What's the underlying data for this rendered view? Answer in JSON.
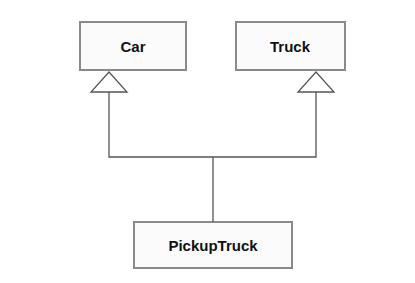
{
  "diagram": {
    "type": "uml-class-inheritance",
    "classes": [
      {
        "id": "car",
        "name": "Car"
      },
      {
        "id": "truck",
        "name": "Truck"
      },
      {
        "id": "pickuptruck",
        "name": "PickupTruck"
      }
    ],
    "relationships": [
      {
        "type": "generalization",
        "from": "PickupTruck",
        "to": "Car"
      },
      {
        "type": "generalization",
        "from": "PickupTruck",
        "to": "Truck"
      }
    ],
    "colors": {
      "box_border": "#8a8a8a",
      "box_fill": "#fbfbfb",
      "line": "#555555",
      "text": "#111111"
    }
  }
}
